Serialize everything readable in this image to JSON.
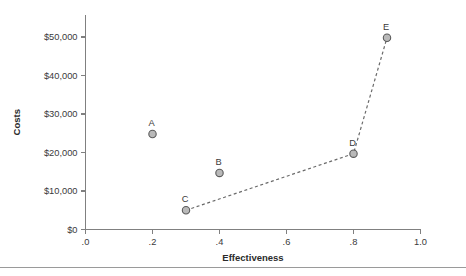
{
  "chart_data": {
    "type": "scatter",
    "title": "",
    "xlabel": "Effectiveness",
    "ylabel": "Costs",
    "xlim": [
      0.0,
      1.0
    ],
    "ylim": [
      0,
      55000
    ],
    "grid": false,
    "legend": "none",
    "xticks": [
      0.0,
      0.2,
      0.4,
      0.6,
      0.8,
      1.0
    ],
    "xticklabels": [
      ".0",
      ".2",
      ".4",
      ".6",
      ".8",
      "1.0"
    ],
    "yticks": [
      0,
      10000,
      20000,
      30000,
      40000,
      50000
    ],
    "yticklabels": [
      "$0",
      "$10,000",
      "$20,000",
      "$30,000",
      "$40,000",
      "$50,000"
    ],
    "points": [
      {
        "label": "A",
        "x": 0.2,
        "y": 24800
      },
      {
        "label": "B",
        "x": 0.4,
        "y": 14700
      },
      {
        "label": "C",
        "x": 0.3,
        "y": 5000
      },
      {
        "label": "D",
        "x": 0.8,
        "y": 19700
      },
      {
        "label": "E",
        "x": 0.9,
        "y": 49800
      }
    ],
    "frontier_line": {
      "style": "dashed",
      "points": [
        {
          "label": "C",
          "x": 0.3,
          "y": 5000
        },
        {
          "label": "D",
          "x": 0.8,
          "y": 19700
        },
        {
          "label": "E",
          "x": 0.9,
          "y": 49800
        }
      ]
    },
    "marker_fill": "#b9b9b9",
    "marker_stroke": "#5a5a5a",
    "line_color": "#6a6a6a",
    "axis_color": "#808080",
    "text_color": "#3a3a3a",
    "background": "#ffffff"
  },
  "footer": {
    "divider_color": "#9a9a9a"
  }
}
